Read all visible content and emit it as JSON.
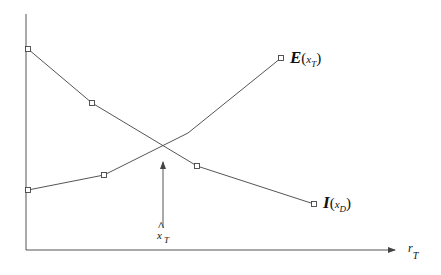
{
  "diagram": {
    "axes": {
      "x_label_main": "r",
      "x_label_sub": "T",
      "y_label": ""
    },
    "curves": [
      {
        "name": "E",
        "label_main": "E",
        "label_open": "(",
        "label_var": "x",
        "label_sub": "T",
        "label_close": ")",
        "points": [
          [
            28,
            190
          ],
          [
            104,
            175
          ],
          [
            188,
            133
          ],
          [
            281,
            58
          ]
        ]
      },
      {
        "name": "I",
        "label_main": "I",
        "label_open": "(",
        "label_var": "x",
        "label_sub": "D",
        "label_close": ")",
        "points": [
          [
            28,
            49
          ],
          [
            92,
            103
          ],
          [
            197,
            166
          ],
          [
            314,
            204
          ]
        ]
      }
    ],
    "marker": {
      "label_hat": "^",
      "label_main": "x",
      "label_sub": "T",
      "x": 163,
      "y_from": 228,
      "y_to": 160
    },
    "colors": {
      "line": "#555555",
      "axis": "#444444",
      "text": "#111111"
    }
  }
}
